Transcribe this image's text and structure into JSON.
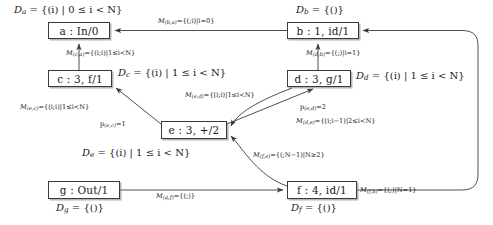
{
  "diagram": {
    "stroke_color": "#3a3a3a",
    "text_color": "#1a1a1a",
    "background": "#ffffff",
    "nodes": [
      {
        "id": "a",
        "label": "a : In/0",
        "name_part": "a",
        "body": " : In/0",
        "x": 48,
        "y": 22,
        "w": 62,
        "h": 17
      },
      {
        "id": "b",
        "label": "b : 1, id/1",
        "name_part": "b",
        "body": " : 1, id/1",
        "x": 287,
        "y": 22,
        "w": 72,
        "h": 17
      },
      {
        "id": "c",
        "label": "c : 3, f/1",
        "name_part": "c",
        "body": " : 3, f/1",
        "x": 48,
        "y": 70,
        "w": 64,
        "h": 17
      },
      {
        "id": "d",
        "label": "d : 3, g/1",
        "name_part": "d",
        "body": " : 3, g/1",
        "x": 287,
        "y": 70,
        "w": 64,
        "h": 17
      },
      {
        "id": "e",
        "label": "e : 3, +/2",
        "name_part": "e",
        "body": " : 3, +/2",
        "x": 161,
        "y": 121,
        "w": 66,
        "h": 18
      },
      {
        "id": "f",
        "label": "f : 4, id/1",
        "name_part": "f",
        "body": " : 4, id/1",
        "x": 287,
        "y": 181,
        "w": 70,
        "h": 18
      },
      {
        "id": "g",
        "label": "g : Out/1",
        "name_part": "g",
        "body": " : Out/1",
        "x": 48,
        "y": 181,
        "w": 72,
        "h": 18
      }
    ],
    "domain_labels": [
      {
        "id": "Da",
        "text": "Da = {(i) | 0 ≤ i < N}",
        "sym": "D",
        "sub": "a",
        "rhs": " = {(i) | 0 ≤ i < N}",
        "x": 14,
        "y": 5
      },
      {
        "id": "Db",
        "text": "Db = {()}",
        "sym": "D",
        "sub": "b",
        "rhs": " = {()}",
        "x": 296,
        "y": 5
      },
      {
        "id": "Dc",
        "text": "Dc = {(i) | 1 ≤ i < N}",
        "sym": "D",
        "sub": "c",
        "rhs": " = {(i) | 1 ≤ i < N}",
        "x": 118,
        "y": 68
      },
      {
        "id": "Dd",
        "text": "Dd = {(i) | 1 ≤ i < N}",
        "sym": "D",
        "sub": "d",
        "rhs": " = {(i) | 1 ≤ i < N}",
        "x": 356,
        "y": 71
      },
      {
        "id": "De",
        "text": "De = {(i) | 1 ≤ i < N}",
        "sym": "D",
        "sub": "e",
        "rhs": " = {(i) | 1 ≤ i < N}",
        "x": 82,
        "y": 148
      },
      {
        "id": "Df",
        "text": "Df = {()}",
        "sym": "D",
        "sub": "f",
        "rhs": " = {()}",
        "x": 291,
        "y": 203
      },
      {
        "id": "Dg",
        "text": "Dg = {()}",
        "sym": "D",
        "sub": "g",
        "rhs": " = {()}",
        "x": 56,
        "y": 203
      }
    ],
    "edge_labels": [
      {
        "id": "Mba",
        "sym": "M",
        "sub": "(b,a)",
        "rhs": "={(;i)|i=0}",
        "x": 158,
        "y": 18
      },
      {
        "id": "Mca",
        "sym": "M",
        "sub": "(c,a)",
        "rhs": "={(i;i)|1≤i<N}",
        "x": 66,
        "y": 50
      },
      {
        "id": "Mdb",
        "sym": "M",
        "sub": "(d,b)",
        "rhs": "={(;)|i=1}",
        "x": 306,
        "y": 50
      },
      {
        "id": "Mec",
        "sym": "M",
        "sub": "(e,c)",
        "rhs": "={(i;i)|1≤i<N}",
        "x": 20,
        "y": 104
      },
      {
        "id": "Med",
        "sym": "M",
        "sub": "(e,d)",
        "rhs": "={(i;i)|1≤i<N}",
        "x": 185,
        "y": 92
      },
      {
        "id": "Mde",
        "sym": "M",
        "sub": "(d,e)",
        "rhs": "={(i;i−1)|2≤i<N}",
        "x": 296,
        "y": 118
      },
      {
        "id": "Mfe",
        "sym": "M",
        "sub": "(f,e)",
        "rhs": "={(;N−1)|N≥2}",
        "x": 253,
        "y": 152
      },
      {
        "id": "Mgf",
        "sym": "M",
        "sub": "(g,f)",
        "rhs": "={(;)}",
        "x": 156,
        "y": 193
      },
      {
        "id": "Mfb",
        "sym": "M",
        "sub": "(f,b)",
        "rhs": "={(;)|N=1}",
        "x": 360,
        "y": 187
      }
    ],
    "priority_labels": [
      {
        "id": "pec",
        "sym": "p",
        "sub": "(e,c)",
        "rhs": "=1",
        "x": 100,
        "y": 121
      },
      {
        "id": "ped",
        "sym": "p",
        "sub": "(e,d)",
        "rhs": "=2",
        "x": 300,
        "y": 104
      }
    ]
  }
}
